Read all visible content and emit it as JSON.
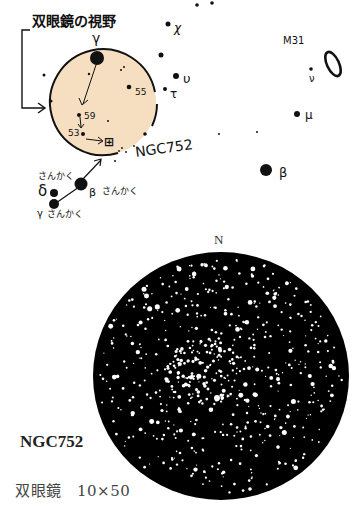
{
  "finder_chart": {
    "fov_label": "双眼鏡の視野",
    "fov_circle": {
      "cx": 103,
      "cy": 102,
      "r": 53,
      "fill": "#F6DEC0"
    },
    "target_label": "NGC752",
    "target_symbol": "⊞",
    "m31_label": "M31",
    "star_labels": {
      "gamma_and": "γ",
      "chi": "χ",
      "upsilon": "υ",
      "tau": "τ",
      "nu": "ν",
      "mu": "μ",
      "beta": "β",
      "num55": "55",
      "num59": "59",
      "num53": "53",
      "delta_tri": "δ",
      "delta_tri_name": "さんかく",
      "beta_tri_name": "さんかく",
      "gamma_tri_name": "さんかく",
      "beta_tri_greek": "β",
      "gamma_tri_greek": "γ"
    }
  },
  "eyepiece_view": {
    "north_label": "N",
    "cx": 221,
    "cy": 376,
    "rx": 128,
    "ry": 124,
    "background": "#000000",
    "star_color": "#ffffff"
  },
  "caption": {
    "title": "NGC752",
    "instrument": "双眼鏡　10×50"
  }
}
